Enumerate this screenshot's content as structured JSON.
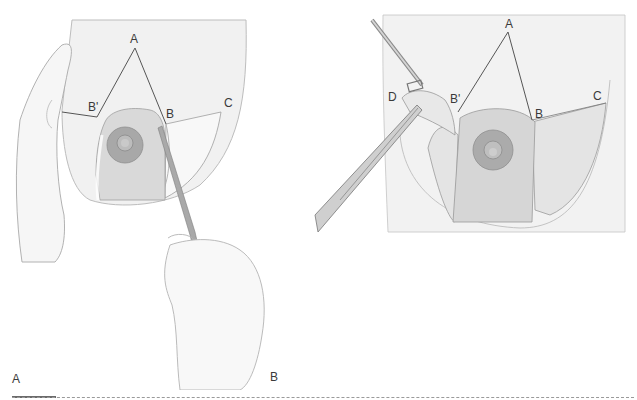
{
  "figure": {
    "panels": [
      {
        "id": "A",
        "caption": "A",
        "point_labels": {
          "A": "A",
          "B_prime": "B'",
          "B": "B",
          "C": "C"
        }
      },
      {
        "id": "B",
        "caption": "B",
        "point_labels": {
          "A": "A",
          "B_prime": "B'",
          "B": "B",
          "C": "C",
          "D": "D"
        }
      }
    ]
  },
  "colors": {
    "skin": "#efefef",
    "skin_shadow": "#dcdcdc",
    "outline": "#8a8a8a",
    "areola": "#a9a9a9",
    "pedicle": "#d2d2d2",
    "tissue": "#e2e2e2",
    "instrument": "#9c9c9c",
    "rule": "#6b6b6b"
  }
}
